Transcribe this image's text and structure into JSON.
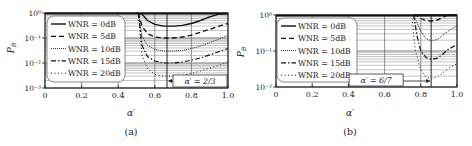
{
  "chart_data": [
    {
      "panel_label": "(a)",
      "type": "line",
      "xlabel": "α′",
      "ylabel": "P_B",
      "yscale": "log",
      "xlim": [
        0,
        1.0
      ],
      "ylim": [
        0.001,
        1
      ],
      "xticks": [
        "0",
        "0.2",
        "0.4",
        "0.6",
        "0.8",
        "1.0"
      ],
      "yticks": [
        "10^0",
        "10^-1",
        "10^-2",
        "10^-3"
      ],
      "grid": true,
      "legend_position": "upper-left",
      "annotation": {
        "text": "α′ = 2/3",
        "x": 0.6667
      },
      "series": [
        {
          "name": "WNR = 0dB",
          "style": "solid",
          "x": [
            0.5,
            0.53,
            0.56,
            0.6,
            0.65,
            0.7,
            0.75,
            0.8,
            0.85,
            0.9,
            0.95,
            1.0
          ],
          "y": [
            1.0,
            0.9,
            0.5,
            0.35,
            0.3,
            0.3,
            0.32,
            0.38,
            0.5,
            0.7,
            0.9,
            0.95
          ]
        },
        {
          "name": "WNR = 5dB",
          "style": "dashed",
          "x": [
            0.51,
            0.53,
            0.56,
            0.6,
            0.65,
            0.7,
            0.75,
            0.8,
            0.85,
            0.9,
            0.95,
            1.0
          ],
          "y": [
            1.0,
            0.3,
            0.15,
            0.11,
            0.1,
            0.1,
            0.11,
            0.13,
            0.17,
            0.22,
            0.3,
            0.38
          ]
        },
        {
          "name": "WNR = 10dB",
          "style": "dotted-dense",
          "x": [
            0.51,
            0.53,
            0.56,
            0.6,
            0.65,
            0.7,
            0.75,
            0.8,
            0.85,
            0.9,
            0.95,
            1.0
          ],
          "y": [
            1.0,
            0.12,
            0.05,
            0.035,
            0.03,
            0.03,
            0.032,
            0.038,
            0.048,
            0.065,
            0.09,
            0.13
          ]
        },
        {
          "name": "WNR = 15dB",
          "style": "dashdot",
          "x": [
            0.51,
            0.53,
            0.56,
            0.6,
            0.65,
            0.7,
            0.75,
            0.8,
            0.85,
            0.9,
            0.95,
            1.0
          ],
          "y": [
            1.0,
            0.05,
            0.018,
            0.012,
            0.01,
            0.01,
            0.011,
            0.013,
            0.016,
            0.021,
            0.028,
            0.038
          ]
        },
        {
          "name": "WNR = 20dB",
          "style": "dotted-sparse",
          "x": [
            0.51,
            0.53,
            0.56,
            0.6,
            0.65,
            0.7,
            0.75,
            0.8,
            0.85,
            0.9,
            0.95,
            1.0
          ],
          "y": [
            1.0,
            0.02,
            0.006,
            0.0035,
            0.003,
            0.003,
            0.0032,
            0.0038,
            0.0048,
            0.0062,
            0.008,
            0.011
          ]
        }
      ]
    },
    {
      "panel_label": "(b)",
      "type": "line",
      "xlabel": "α′",
      "ylabel": "P_B",
      "yscale": "log",
      "xlim": [
        0,
        1.0
      ],
      "ylim": [
        0.01,
        1
      ],
      "xticks": [
        "0",
        "0.2",
        "0.4",
        "0.6",
        "0.8",
        "1.0"
      ],
      "yticks": [
        "10^0",
        "10^-1",
        "10^-2"
      ],
      "grid": true,
      "legend_position": "upper-left",
      "annotation": {
        "text": "α′ = 6/7",
        "x": 0.8571
      },
      "series": [
        {
          "name": "WNR = 0dB",
          "style": "solid",
          "x": [
            0.76,
            0.8,
            0.85,
            0.9,
            0.95,
            1.0
          ],
          "y": [
            1.0,
            1.0,
            1.0,
            1.0,
            1.0,
            1.0
          ]
        },
        {
          "name": "WNR = 5dB",
          "style": "dashed",
          "x": [
            0.76,
            0.78,
            0.8,
            0.83,
            0.86,
            0.89,
            0.92,
            0.95,
            1.0
          ],
          "y": [
            1.0,
            0.95,
            0.8,
            0.7,
            0.68,
            0.72,
            0.85,
            1.0,
            1.0
          ]
        },
        {
          "name": "WNR = 10dB",
          "style": "dotted-dense",
          "x": [
            0.76,
            0.78,
            0.8,
            0.83,
            0.86,
            0.89,
            0.92,
            0.95,
            1.0
          ],
          "y": [
            1.0,
            0.6,
            0.35,
            0.22,
            0.19,
            0.21,
            0.27,
            0.35,
            0.5
          ]
        },
        {
          "name": "WNR = 15dB",
          "style": "dashdot",
          "x": [
            0.76,
            0.78,
            0.8,
            0.83,
            0.86,
            0.89,
            0.92,
            0.95,
            1.0
          ],
          "y": [
            1.0,
            0.25,
            0.1,
            0.065,
            0.058,
            0.063,
            0.08,
            0.11,
            0.15
          ]
        },
        {
          "name": "WNR = 20dB",
          "style": "dotted-sparse",
          "x": [
            0.75,
            0.77,
            0.8,
            0.83,
            0.86,
            0.89,
            0.92,
            0.95,
            1.0
          ],
          "y": [
            1.0,
            0.1,
            0.03,
            0.019,
            0.017,
            0.019,
            0.024,
            0.032,
            0.045
          ]
        }
      ]
    }
  ]
}
